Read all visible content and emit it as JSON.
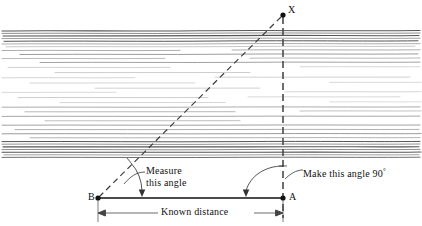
{
  "figure": {
    "type": "survey-diagram",
    "scene": "A river spanned by a surveying triangle used to measure river width"
  },
  "points": {
    "x": {
      "label": "X",
      "x": 283,
      "y": 15,
      "desc": "target point on far bank"
    },
    "a": {
      "label": "A",
      "x": 283,
      "y": 198,
      "desc": "baseline right end, below X"
    },
    "b": {
      "label": "B",
      "x": 98,
      "y": 198,
      "desc": "baseline left end, observation point"
    }
  },
  "annotations": {
    "measure_angle": {
      "line1": "Measure",
      "line2": "this angle"
    },
    "right_angle": {
      "text": "Make this angle 90",
      "degree_symbol": "°"
    },
    "known_distance": {
      "text": "Known distance"
    }
  },
  "colors": {
    "ink": "#111111",
    "baseline": "#111111",
    "dashed": "#3a3a3a",
    "water_dark": "#555555",
    "water_light": "#b8b8b8",
    "dimension": "#444444",
    "background": "#ffffff"
  },
  "geometry": {
    "baseline": {
      "from": "B",
      "to": "A",
      "y": 198
    },
    "sight_line": {
      "from": "B",
      "to": "X",
      "style": "dashed"
    },
    "vertical_line": {
      "from": "X",
      "to": "A",
      "style": "dashed",
      "x": 283
    },
    "dimension_line": {
      "y": 213,
      "from_x": 98,
      "to_x": 283
    }
  }
}
